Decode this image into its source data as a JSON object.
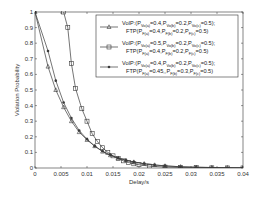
{
  "chart_data": {
    "type": "line",
    "title": "",
    "xlabel": "Delay/s",
    "ylabel": "Violation Probability",
    "xlim": [
      0,
      0.04
    ],
    "ylim": [
      0,
      1
    ],
    "xticks": [
      "0",
      "0.005",
      "0.01",
      "0.015",
      "0.02",
      "0.025",
      "0.03",
      "0.035",
      "0.04"
    ],
    "yticks": [
      "0",
      "0.1",
      "0.2",
      "0.3",
      "0.4",
      "0.5",
      "0.6",
      "0.7",
      "0.8",
      "0.9",
      "1"
    ],
    "grid": false,
    "legend_position": "upper right",
    "series": [
      {
        "name": "VoIP:(P_Vo(a)=0.4,P_Vo(b)=0.2,P_Vo(c)=0.5); FTP(P_F(a)=0.4,P_F(b)=0.2,P_F(c)=0.5)",
        "legend_line1": [
          "VoIP:(P",
          "Vo(a)",
          "=0.4,P",
          "Vo(b)",
          "=0.2,P",
          "Vo(c)",
          "=0.5);"
        ],
        "legend_line2": [
          "FTP(P",
          "F(a)",
          "=0.4,P",
          "F(b)",
          "=0.2,P",
          "F(c)",
          "=0.5)"
        ],
        "marker": "triangle",
        "x": [
          0,
          0.0025,
          0.004,
          0.0055,
          0.007,
          0.0085,
          0.01,
          0.0115,
          0.013,
          0.0145,
          0.016,
          0.0175,
          0.019,
          0.021,
          0.023,
          0.025,
          0.028,
          0.031,
          0.034,
          0.037,
          0.04
        ],
        "y": [
          1,
          0.65,
          0.5,
          0.39,
          0.3,
          0.23,
          0.18,
          0.14,
          0.105,
          0.082,
          0.063,
          0.049,
          0.038,
          0.027,
          0.019,
          0.013,
          0.008,
          0.005,
          0.003,
          0.002,
          0.001
        ]
      },
      {
        "name": "VoIP:(P_Vo(a)=0.5,P_Vo(b)=0.2,P_Vo(c)=0.5); FTP(P_F(a)=0.4,P_F(b)=0.2,P_F(c)=0.5)",
        "legend_line1": [
          "VoIP:(P",
          "Vo(a)",
          "=0.5,P",
          "Vo(b)",
          "=0.2,P",
          "Vo(c)",
          "=0.5);"
        ],
        "legend_line2": [
          "FTP(P",
          "F(a)",
          "=0.4,P",
          "F(b)",
          "=0.2,P",
          "F(c)",
          "=0.5)"
        ],
        "marker": "square",
        "x": [
          0.0055,
          0.0063,
          0.007,
          0.0078,
          0.009,
          0.01,
          0.011,
          0.012,
          0.013,
          0.014,
          0.015,
          0.016,
          0.017,
          0.018,
          0.019,
          0.02,
          0.022,
          0.025,
          0.028,
          0.031,
          0.034,
          0.037,
          0.04
        ],
        "y": [
          1,
          0.9,
          0.67,
          0.51,
          0.38,
          0.3,
          0.22,
          0.17,
          0.13,
          0.1,
          0.078,
          0.06,
          0.046,
          0.035,
          0.027,
          0.021,
          0.012,
          0.006,
          0.003,
          0.002,
          0.001,
          0.0005,
          0.0003
        ]
      },
      {
        "name": "VoIP:(P_Vo(a)=0.4,P_Vo(b)=0.2,P_Vo(c)=0.5); FTP(P_F(a)=0.45,P_F(b)=0.3,P_F(c)=0.5)",
        "legend_line1": [
          "VoIP:(P",
          "Vo(a)",
          "=0.4,P",
          "Vo(b)",
          "=0.2,P",
          "Vo(c)",
          "=0.5);"
        ],
        "legend_line2": [
          "FTP(P",
          "F(a)",
          "=0.45,,P",
          "F(b)",
          "=0.3,P",
          "F(c)",
          "=0.5)"
        ],
        "marker": "star",
        "x": [
          0,
          0.0025,
          0.004,
          0.0055,
          0.007,
          0.0085,
          0.01,
          0.0115,
          0.013,
          0.0145,
          0.016,
          0.0175,
          0.019,
          0.021,
          0.023,
          0.025,
          0.028,
          0.031,
          0.034,
          0.037,
          0.04
        ],
        "y": [
          1,
          0.75,
          0.56,
          0.42,
          0.32,
          0.24,
          0.185,
          0.14,
          0.107,
          0.083,
          0.064,
          0.05,
          0.039,
          0.028,
          0.02,
          0.014,
          0.008,
          0.005,
          0.003,
          0.002,
          0.001
        ]
      }
    ]
  },
  "colors": {
    "line": "#3a3a3a",
    "axis": "#333333",
    "background": "#ffffff"
  }
}
